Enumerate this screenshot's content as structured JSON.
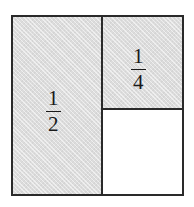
{
  "figure": {
    "kind": "fraction-area-diagram",
    "background_color": "#ffffff",
    "line_color": "#2a2a2a",
    "shade_color": "#dcdcdc",
    "text_color": "#1a1a1a"
  },
  "regions": [
    {
      "id": "half",
      "label_numerator": "1",
      "label_denominator": "2",
      "fraction_text": "1/2",
      "shaded": true,
      "position": "left-column"
    },
    {
      "id": "quarter",
      "label_numerator": "1",
      "label_denominator": "4",
      "fraction_text": "1/4",
      "shaded": true,
      "position": "top-right"
    },
    {
      "id": "empty",
      "label_numerator": "",
      "label_denominator": "",
      "fraction_text": "",
      "shaded": false,
      "position": "bottom-right"
    }
  ]
}
